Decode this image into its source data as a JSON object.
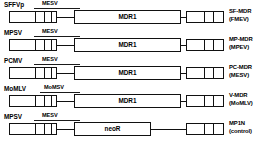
{
  "figure": {
    "type": "retroviral-vector-construct-diagram",
    "gene_label_mdr1": "MDR1",
    "gene_label_neor": "neoR",
    "rows": [
      {
        "promoter": "SFFVp",
        "enhancer": "MESV",
        "gene": "MDR1",
        "construct_name": "SF-MDR",
        "construct_backbone": "(FMEV)"
      },
      {
        "promoter": "MPSV",
        "enhancer": "MESV",
        "gene": "MDR1",
        "construct_name": "MP-MDR",
        "construct_backbone": "(MPEV)"
      },
      {
        "promoter": "PCMV",
        "enhancer": "MESV",
        "gene": "MDR1",
        "construct_name": "PC-MDR",
        "construct_backbone": "(MESV)"
      },
      {
        "promoter": "MoMLV",
        "enhancer": "MoMSV",
        "gene": "MDR1",
        "construct_name": "V-MDR",
        "construct_backbone": "(MoMLV)"
      },
      {
        "promoter": "MPSV",
        "enhancer": "MESV",
        "gene": "neoR",
        "construct_name": "MP1N",
        "construct_backbone": "(control)"
      }
    ]
  },
  "colors": {
    "stroke": "#111111",
    "background": "#ffffff",
    "text": "#000000"
  }
}
